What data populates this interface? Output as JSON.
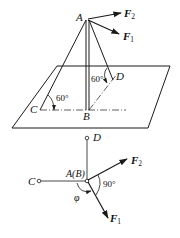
{
  "figure": {
    "colors": {
      "line": "#1a1a1a",
      "background": "#ffffff"
    }
  },
  "perspective_view": {
    "points": {
      "A": "A",
      "B": "B",
      "C": "C",
      "D": "D"
    },
    "forces": {
      "F1": {
        "letter": "F",
        "sub": "1"
      },
      "F2": {
        "letter": "F",
        "sub": "2"
      }
    },
    "angles": {
      "angle_C": "60°",
      "angle_D": "60°"
    }
  },
  "top_view": {
    "points": {
      "D": "D",
      "C": "C",
      "AB": "A(B)"
    },
    "forces": {
      "F1": {
        "letter": "F",
        "sub": "1"
      },
      "F2": {
        "letter": "F",
        "sub": "2"
      }
    },
    "angles": {
      "right_angle": "90°",
      "phi": "φ"
    }
  }
}
